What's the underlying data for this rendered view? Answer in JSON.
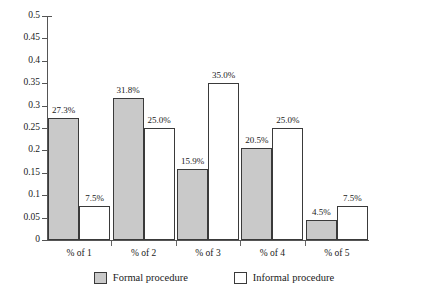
{
  "chart_data": {
    "type": "bar",
    "title": "",
    "subtitle": "",
    "xlabel": "",
    "ylabel": "",
    "categories": [
      "% of 1",
      "% of 2",
      "% of 3",
      "% of 4",
      "% of 5"
    ],
    "series": [
      {
        "name": "Formal procedure",
        "color": "#c9c9c9",
        "values": [
          0.273,
          0.318,
          0.159,
          0.205,
          0.045
        ],
        "labels": [
          "27.3%",
          "31.8%",
          "15.9%",
          "20.5%",
          "4.5%"
        ]
      },
      {
        "name": "Informal procedure",
        "color": "#ffffff",
        "values": [
          0.075,
          0.25,
          0.35,
          0.25,
          0.075
        ],
        "labels": [
          "7.5%",
          "25.0%",
          "35.0%",
          "25.0%",
          "7.5%"
        ]
      }
    ],
    "ylim": [
      0,
      0.5
    ],
    "ytick_labels": [
      "0",
      "0.05",
      "0.1",
      "0.15",
      "0.2",
      "0.25",
      "0.3",
      "0.35",
      "0.4",
      "0.45",
      "0.5"
    ],
    "ytick_values": [
      0,
      0.05,
      0.1,
      0.15,
      0.2,
      0.25,
      0.3,
      0.35,
      0.4,
      0.45,
      0.5
    ],
    "grid": false,
    "legend_position": "bottom"
  },
  "legend": {
    "items": [
      {
        "label": "Formal procedure",
        "swatch": "formal"
      },
      {
        "label": "Informal procedure",
        "swatch": "informal"
      }
    ]
  }
}
